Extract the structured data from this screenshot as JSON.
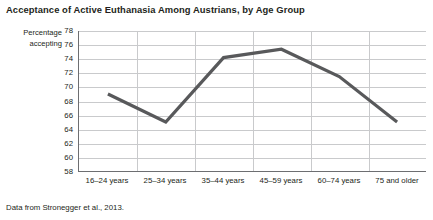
{
  "chart_data": {
    "type": "line",
    "title": "Acceptance of Active Euthanasia Among Austrians, by Age Group",
    "xlabel": "",
    "ylabel": "Percentage accepting",
    "ylabel_line1": "Percentage",
    "ylabel_line2": "accepting",
    "categories": [
      "16–24 years",
      "25–34 years",
      "35–44 years",
      "45–59 years",
      "60–74 years",
      "75 and older"
    ],
    "values": [
      69.0,
      65.0,
      74.2,
      75.4,
      71.5,
      65.0
    ],
    "series": [
      {
        "name": "Percentage accepting",
        "values": [
          69.0,
          65.0,
          74.2,
          75.4,
          71.5,
          65.0
        ]
      }
    ],
    "ylim": [
      58,
      78
    ],
    "ytick_values": [
      78,
      76,
      74,
      72,
      70,
      68,
      66,
      64,
      62,
      60,
      58
    ],
    "ytick_labels": [
      "78",
      "76",
      "74",
      "72",
      "70",
      "68",
      "66",
      "64",
      "62",
      "60",
      "58"
    ],
    "grid": true,
    "grid_axis": "both",
    "legend": false,
    "line_color": "#58595b",
    "grid_color": "#c9cacc",
    "axis_color": "#6d6e71",
    "text_color": "#231f20",
    "background": "#ffffff",
    "source_note": "Data from Stronegger et al., 2013."
  }
}
